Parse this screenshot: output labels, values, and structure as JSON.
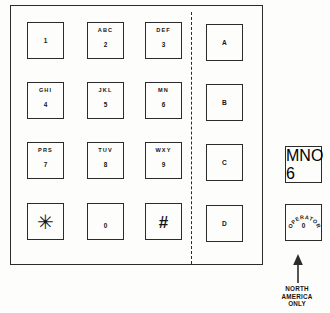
{
  "diagram": {
    "colors": {
      "line": "#2b2b2b",
      "text": "#151515",
      "background": "#fdfdfc"
    }
  },
  "keypad": {
    "rows": [
      [
        {
          "letters": "",
          "digit": "1",
          "name": "key-1"
        },
        {
          "letters": "ABC",
          "digit": "2",
          "name": "key-2"
        },
        {
          "letters": "DEF",
          "digit": "3",
          "name": "key-3"
        },
        {
          "letters": "",
          "digit": "A",
          "name": "key-a"
        }
      ],
      [
        {
          "letters": "GHI",
          "digit": "4",
          "name": "key-4"
        },
        {
          "letters": "JKL",
          "digit": "5",
          "name": "key-5"
        },
        {
          "letters": "MN",
          "digit": "6",
          "name": "key-6"
        },
        {
          "letters": "",
          "digit": "B",
          "name": "key-b"
        }
      ],
      [
        {
          "letters": "PRS",
          "digit": "7",
          "name": "key-7"
        },
        {
          "letters": "TUV",
          "digit": "8",
          "name": "key-8"
        },
        {
          "letters": "WXY",
          "digit": "9",
          "name": "key-9"
        },
        {
          "letters": "",
          "digit": "C",
          "name": "key-c"
        }
      ],
      [
        {
          "letters": "",
          "digit": "✳",
          "name": "key-star"
        },
        {
          "letters": "",
          "digit": "0",
          "name": "key-0"
        },
        {
          "letters": "",
          "digit": "#",
          "name": "key-hash"
        },
        {
          "letters": "",
          "digit": "D",
          "name": "key-d"
        }
      ]
    ],
    "cells": {
      "r0c0": {
        "letters": "",
        "digit": "1"
      },
      "r0c1": {
        "letters": "ABC",
        "digit": "2"
      },
      "r0c2": {
        "letters": "DEF",
        "digit": "3"
      },
      "r0c3": {
        "letters": "",
        "digit": "A"
      },
      "r1c0": {
        "letters": "GHI",
        "digit": "4"
      },
      "r1c1": {
        "letters": "JKL",
        "digit": "5"
      },
      "r1c2": {
        "letters": "MN",
        "digit": "6"
      },
      "r1c3": {
        "letters": "",
        "digit": "B"
      },
      "r2c0": {
        "letters": "PRS",
        "digit": "7"
      },
      "r2c1": {
        "letters": "TUV",
        "digit": "8"
      },
      "r2c2": {
        "letters": "WXY",
        "digit": "9"
      },
      "r2c3": {
        "letters": "",
        "digit": "C"
      },
      "r3c0": {
        "letters": "",
        "glyph": "✳"
      },
      "r3c1": {
        "letters": "",
        "digit": "0"
      },
      "r3c2": {
        "letters": "",
        "glyph": "#"
      },
      "r3c3": {
        "letters": "",
        "digit": "D"
      }
    }
  },
  "variants": {
    "mno_key": {
      "letters": "MNO",
      "digit": "6"
    },
    "operator_key": {
      "arc_label": "OPERATOR",
      "digit": "0"
    },
    "note": {
      "line1": "NORTH",
      "line2": "AMERICA",
      "line3": "ONLY"
    }
  }
}
